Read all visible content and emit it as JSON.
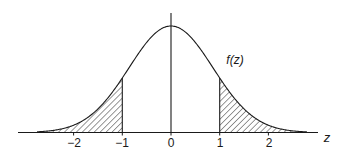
{
  "chart_data": {
    "type": "area",
    "title": "",
    "curve_label": "f(z)",
    "xlabel": "z",
    "ylabel": "",
    "xlim": [
      -2.8,
      3.0
    ],
    "x_ticks": [
      -2,
      -1,
      0,
      1,
      2
    ],
    "x_tick_labels": [
      "−2",
      "−1",
      "0",
      "1",
      "2"
    ],
    "shaded_regions": [
      {
        "name": "left-tail",
        "from": "-inf",
        "to": -1,
        "pattern": "diagonal-hatch"
      },
      {
        "name": "right-tail",
        "from": 1,
        "to": "inf",
        "pattern": "diagonal-hatch"
      }
    ],
    "series": [
      {
        "name": "f(z)",
        "distribution": "standard normal",
        "mean": 0,
        "sd": 1
      }
    ],
    "grid": false,
    "legend": "none"
  },
  "colors": {
    "ink": "#1a1a1a",
    "background": "#ffffff"
  }
}
